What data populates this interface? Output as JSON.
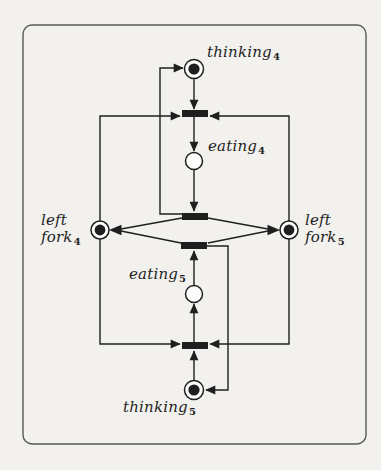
{
  "colors": {
    "ink": "#1f1f1f",
    "paper": "#f2f1ee",
    "box-border": "#585858"
  },
  "labels": {
    "thinking4": {
      "text": "thinking",
      "sub": "4"
    },
    "eating4": {
      "text": "eating",
      "sub": "4"
    },
    "left_fork4": {
      "line1": "left",
      "line2": "fork",
      "sub": "4"
    },
    "left_fork5": {
      "line1": "left",
      "line2": "fork",
      "sub": "5"
    },
    "eating5": {
      "text": "eating",
      "sub": "5"
    },
    "thinking5": {
      "text": "thinking",
      "sub": "5"
    }
  },
  "net": {
    "type": "petri-net",
    "places": [
      "thinking4",
      "eating4",
      "left_fork4",
      "left_fork5",
      "eating5",
      "thinking5"
    ],
    "marking": {
      "thinking4": 1,
      "eating4": 0,
      "left_fork4": 1,
      "left_fork5": 1,
      "eating5": 0,
      "thinking5": 1
    },
    "transitions_count": 4
  }
}
